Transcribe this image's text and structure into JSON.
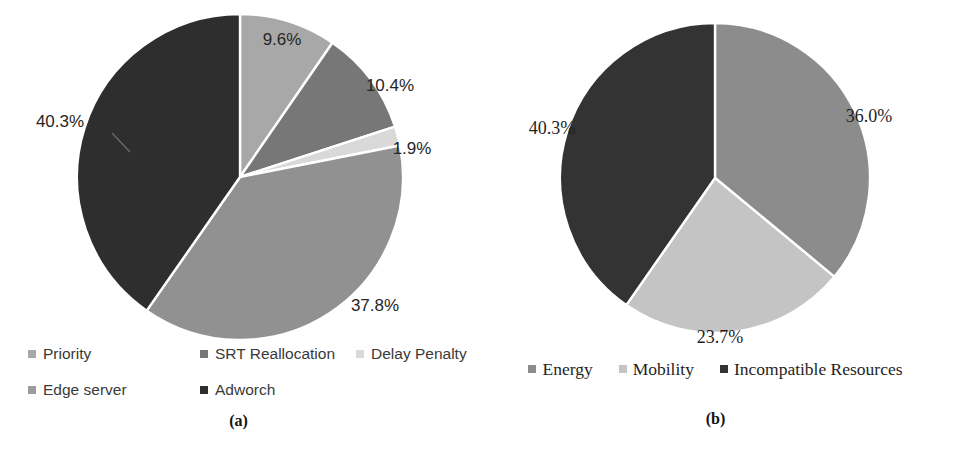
{
  "figure": {
    "background_color": "#ffffff",
    "panels": [
      {
        "id": "a",
        "caption": "(a)",
        "legend_font": "sans-serif",
        "chart_data": {
          "type": "pie",
          "title": "",
          "categories": [
            "Priority",
            "SRT Reallocation",
            "Delay Penalty",
            "Edge server",
            "Adworch"
          ],
          "values": [
            9.6,
            10.4,
            1.9,
            37.8,
            40.3
          ],
          "value_labels": [
            "9.6%",
            "10.4%",
            "1.9%",
            "37.8%",
            "40.3%"
          ],
          "colors": [
            "#a8a8a8",
            "#777777",
            "#d9d9d9",
            "#919191",
            "#2e2e2e"
          ],
          "unit": "%",
          "start_angle_deg": 0,
          "direction": "clockwise",
          "legend_position": "bottom",
          "legend_entries": [
            {
              "label": "Priority",
              "color": "#a8a8a8"
            },
            {
              "label": "SRT Reallocation",
              "color": "#777777"
            },
            {
              "label": "Delay Penalty",
              "color": "#d9d9d9"
            },
            {
              "label": "Edge server",
              "color": "#9b9b9b"
            },
            {
              "label": "Adworch",
              "color": "#2e2e2e"
            }
          ]
        }
      },
      {
        "id": "b",
        "caption": "(b)",
        "legend_font": "serif",
        "chart_data": {
          "type": "pie",
          "title": "",
          "categories": [
            "Energy",
            "Mobility",
            "Incompatible Resources"
          ],
          "values": [
            36.0,
            23.7,
            40.3
          ],
          "value_labels": [
            "36.0%",
            "23.7%",
            "40.3%"
          ],
          "colors": [
            "#8c8c8c",
            "#c4c4c4",
            "#333333"
          ],
          "unit": "%",
          "start_angle_deg": 0,
          "direction": "clockwise",
          "legend_position": "bottom",
          "legend_entries": [
            {
              "label": "Energy",
              "color": "#8c8c8c"
            },
            {
              "label": "Mobility",
              "color": "#c4c4c4"
            },
            {
              "label": "Incompatible Resources",
              "color": "#333333"
            }
          ]
        }
      }
    ]
  },
  "chart_data": [
    {
      "type": "pie",
      "panel": "(a)",
      "title": "",
      "categories": [
        "Priority",
        "SRT Reallocation",
        "Delay Penalty",
        "Edge server",
        "Adworch"
      ],
      "values": [
        9.6,
        10.4,
        1.9,
        37.8,
        40.3
      ],
      "value_labels": [
        "9.6%",
        "10.4%",
        "1.9%",
        "37.8%",
        "40.3%"
      ],
      "colors": [
        "#a8a8a8",
        "#777777",
        "#d9d9d9",
        "#919191",
        "#2e2e2e"
      ],
      "legend_position": "bottom",
      "xlabel": "",
      "ylabel": ""
    },
    {
      "type": "pie",
      "panel": "(b)",
      "title": "",
      "categories": [
        "Energy",
        "Mobility",
        "Incompatible Resources"
      ],
      "values": [
        36.0,
        23.7,
        40.3
      ],
      "value_labels": [
        "36.0%",
        "23.7%",
        "40.3%"
      ],
      "colors": [
        "#8c8c8c",
        "#c4c4c4",
        "#333333"
      ],
      "legend_position": "bottom",
      "xlabel": "",
      "ylabel": ""
    }
  ],
  "labels_a": {
    "p0": "9.6%",
    "p1": "10.4%",
    "p2": "1.9%",
    "p3": "37.8%",
    "p4": "40.3%"
  },
  "labels_b": {
    "p0": "36.0%",
    "p1": "23.7%",
    "p2": "40.3%"
  },
  "legend_a": {
    "i0": "Priority",
    "i1": "SRT Reallocation",
    "i2": "Delay Penalty",
    "i3": "Edge server",
    "i4": "Adworch"
  },
  "legend_b": {
    "i0": "Energy",
    "i1": "Mobility",
    "i2": "Incompatible Resources"
  },
  "captions": {
    "a": "(a)",
    "b": "(b)"
  }
}
